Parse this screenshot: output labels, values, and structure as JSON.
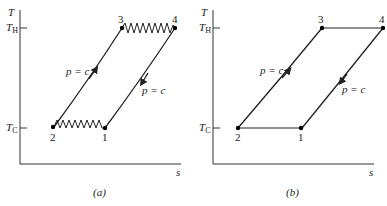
{
  "panels": [
    {
      "id": "a",
      "caption": "(a)",
      "y_axis_label": "T",
      "x_axis_label": "s",
      "th_label": "T",
      "th_sub": "H",
      "tc_label": "T",
      "tc_sub": "C",
      "points": {
        "p1": "1",
        "p2": "2",
        "p3": "3",
        "p4": "4"
      },
      "process_labels": {
        "left": "p = c",
        "right": "p = c"
      },
      "heat_exchange_style": "zigzag (irreversible)"
    },
    {
      "id": "b",
      "caption": "(b)",
      "y_axis_label": "T",
      "x_axis_label": "s",
      "th_label": "T",
      "th_sub": "H",
      "tc_label": "T",
      "tc_sub": "C",
      "points": {
        "p1": "1",
        "p2": "2",
        "p3": "3",
        "p4": "4"
      },
      "process_labels": {
        "left": "p = c",
        "right": "p = c"
      },
      "heat_exchange_style": "straight line (reversible)"
    }
  ]
}
